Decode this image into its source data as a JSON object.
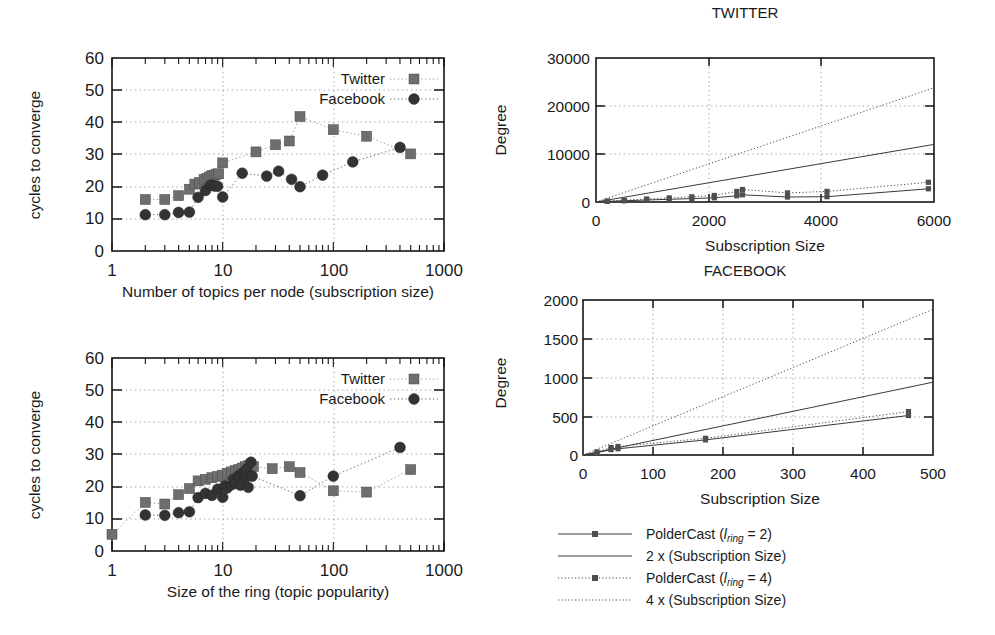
{
  "figure": {
    "panels": [
      "convergence-subscription-size",
      "convergence-ring-size",
      "degree-twitter",
      "degree-facebook"
    ]
  },
  "panel_tl": {
    "ylabel": "cycles to converge",
    "xlabel": "Number of topics per node (subscription size)",
    "yticks": [
      "0",
      "10",
      "20",
      "30",
      "40",
      "50",
      "60"
    ],
    "xticks": [
      "1",
      "10",
      "100",
      "1000"
    ],
    "legend": [
      {
        "label": "Twitter",
        "marker": "square",
        "color": "#6e6e6e"
      },
      {
        "label": "Facebook",
        "marker": "circle",
        "color": "#333333"
      }
    ]
  },
  "panel_bl": {
    "ylabel": "cycles to converge",
    "xlabel": "Size of the ring (topic popularity)",
    "yticks": [
      "0",
      "10",
      "20",
      "30",
      "40",
      "50",
      "60"
    ],
    "xticks": [
      "1",
      "10",
      "100",
      "1000"
    ],
    "legend": [
      {
        "label": "Twitter",
        "marker": "square",
        "color": "#6e6e6e"
      },
      {
        "label": "Facebook",
        "marker": "circle",
        "color": "#333333"
      }
    ]
  },
  "panel_tr": {
    "title": "TWITTER",
    "ylabel": "Degree",
    "xlabel": "Subscription Size",
    "yticks": [
      "0",
      "10000",
      "20000",
      "30000"
    ],
    "xticks": [
      "0",
      "2000",
      "4000",
      "6000"
    ]
  },
  "panel_br": {
    "title": "FACEBOOK",
    "ylabel": "Degree",
    "xlabel": "Subscription Size",
    "yticks": [
      "0",
      "500",
      "1000",
      "1500",
      "2000"
    ],
    "xticks": [
      "0",
      "100",
      "200",
      "300",
      "400",
      "500"
    ]
  },
  "legend_right": {
    "entries": [
      {
        "label_pre": "PolderCast (",
        "label_sym": "l",
        "label_sub": "ring",
        "label_post": " = 2)",
        "style": "solid-with-square"
      },
      {
        "label_pre": "2 x (Subscription Size)",
        "label_sym": "",
        "label_sub": "",
        "label_post": "",
        "style": "solid"
      },
      {
        "label_pre": "PolderCast (",
        "label_sym": "l",
        "label_sub": "ring",
        "label_post": " = 4)",
        "style": "dotted-with-square"
      },
      {
        "label_pre": "4 x (Subscription Size)",
        "label_sym": "",
        "label_sub": "",
        "label_post": "",
        "style": "dotted"
      }
    ]
  },
  "chart_data": [
    {
      "type": "scatter",
      "id": "convergence-vs-subscription-size",
      "title": "",
      "xlabel": "Number of topics per node (subscription size)",
      "ylabel": "cycles to converge",
      "xscale": "log",
      "xlim": [
        1,
        1000
      ],
      "yscale": "linear",
      "ylim": [
        0,
        60
      ],
      "grid": true,
      "legend_position": "top-right",
      "series": [
        {
          "name": "Twitter",
          "marker": "square",
          "color": "#6e6e6e",
          "points": [
            [
              2,
              16
            ],
            [
              3,
              16
            ],
            [
              4,
              17.2
            ],
            [
              5,
              19.2
            ],
            [
              5.6,
              20.8
            ],
            [
              6.2,
              21.3
            ],
            [
              6.8,
              22.3
            ],
            [
              7.2,
              22.6
            ],
            [
              7.6,
              23.0
            ],
            [
              8,
              23.4
            ],
            [
              8.4,
              23.6
            ],
            [
              8.8,
              23.9
            ],
            [
              9.2,
              24.0
            ],
            [
              10,
              27.4
            ],
            [
              20,
              30.8
            ],
            [
              30,
              33.0
            ],
            [
              40,
              34.2
            ],
            [
              50,
              41.8
            ],
            [
              100,
              37.7
            ],
            [
              200,
              35.7
            ],
            [
              500,
              30.2
            ]
          ]
        },
        {
          "name": "Facebook",
          "marker": "circle",
          "color": "#333333",
          "points": [
            [
              2,
              11.3
            ],
            [
              3,
              11.3
            ],
            [
              4,
              12.0
            ],
            [
              5,
              12.1
            ],
            [
              6,
              16.7
            ],
            [
              7,
              18.8
            ],
            [
              7.8,
              20.5
            ],
            [
              8.4,
              20.2
            ],
            [
              9,
              20.1
            ],
            [
              10,
              16.8
            ],
            [
              15,
              24.2
            ],
            [
              25,
              23.3
            ],
            [
              32,
              24.8
            ],
            [
              42,
              22.3
            ],
            [
              50,
              20.0
            ],
            [
              80,
              23.6
            ],
            [
              150,
              27.7
            ],
            [
              400,
              32.2
            ]
          ]
        }
      ]
    },
    {
      "type": "scatter",
      "id": "convergence-vs-ring-size",
      "title": "",
      "xlabel": "Size of the ring (topic popularity)",
      "ylabel": "cycles to converge",
      "xscale": "log",
      "xlim": [
        1,
        1000
      ],
      "yscale": "linear",
      "ylim": [
        0,
        60
      ],
      "grid": true,
      "legend_position": "top-right",
      "series": [
        {
          "name": "Twitter",
          "marker": "square",
          "color": "#6e6e6e",
          "points": [
            [
              1,
              5.2
            ],
            [
              2,
              15.1
            ],
            [
              3,
              14.6
            ],
            [
              4,
              17.5
            ],
            [
              5,
              19.4
            ],
            [
              6,
              21.8
            ],
            [
              7,
              22.3
            ],
            [
              8,
              22.8
            ],
            [
              9,
              23.2
            ],
            [
              10,
              23.6
            ],
            [
              11,
              24.2
            ],
            [
              12,
              24.6
            ],
            [
              13,
              25.0
            ],
            [
              14,
              25.4
            ],
            [
              15,
              25.8
            ],
            [
              16,
              26.2
            ],
            [
              17,
              26.5
            ],
            [
              18,
              26.8
            ],
            [
              19,
              26.2
            ],
            [
              28,
              25.6
            ],
            [
              40,
              26.2
            ],
            [
              50,
              24.4
            ],
            [
              100,
              18.7
            ],
            [
              200,
              18.3
            ],
            [
              500,
              25.3
            ]
          ]
        },
        {
          "name": "Facebook",
          "marker": "circle",
          "color": "#333333",
          "points": [
            [
              2,
              11.2
            ],
            [
              3,
              11.1
            ],
            [
              4,
              11.9
            ],
            [
              5,
              12.2
            ],
            [
              6,
              16.6
            ],
            [
              7,
              17.9
            ],
            [
              8,
              17.3
            ],
            [
              9,
              19.2
            ],
            [
              10,
              16.7
            ],
            [
              10.5,
              20.3
            ],
            [
              11,
              19.6
            ],
            [
              12,
              20.6
            ],
            [
              12.5,
              22.3
            ],
            [
              13,
              21.0
            ],
            [
              14,
              23.4
            ],
            [
              14.5,
              20.5
            ],
            [
              15,
              24.2
            ],
            [
              16,
              22.8
            ],
            [
              16.5,
              25.5
            ],
            [
              17,
              19.8
            ],
            [
              18,
              27.6
            ],
            [
              18.5,
              23.3
            ],
            [
              50,
              17.2
            ],
            [
              100,
              23.3
            ],
            [
              400,
              32.2
            ]
          ]
        }
      ]
    },
    {
      "type": "line",
      "id": "degree-twitter",
      "title": "TWITTER",
      "xlabel": "Subscription Size",
      "ylabel": "Degree",
      "xlim": [
        0,
        6000
      ],
      "ylim": [
        0,
        30000
      ],
      "grid": true,
      "series": [
        {
          "name": "PolderCast (l_ring = 2)",
          "style": "solid-with-square",
          "points": [
            [
              0,
              0
            ],
            [
              200,
              120
            ],
            [
              500,
              260
            ],
            [
              900,
              420
            ],
            [
              1300,
              560
            ],
            [
              1700,
              700
            ],
            [
              2100,
              880
            ],
            [
              2500,
              1300
            ],
            [
              2600,
              1500
            ],
            [
              3400,
              1050
            ],
            [
              4100,
              1100
            ],
            [
              5900,
              2750
            ]
          ]
        },
        {
          "name": "2 x (Subscription Size)",
          "style": "solid",
          "points": [
            [
              0,
              0
            ],
            [
              6000,
              12000
            ]
          ]
        },
        {
          "name": "PolderCast (l_ring = 4)",
          "style": "dotted-with-square",
          "points": [
            [
              0,
              0
            ],
            [
              200,
              180
            ],
            [
              500,
              380
            ],
            [
              900,
              620
            ],
            [
              1300,
              860
            ],
            [
              1700,
              1080
            ],
            [
              2100,
              1350
            ],
            [
              2500,
              2200
            ],
            [
              2600,
              2600
            ],
            [
              3400,
              1900
            ],
            [
              4100,
              2200
            ],
            [
              5900,
              4100
            ]
          ]
        },
        {
          "name": "4 x (Subscription Size)",
          "style": "dotted",
          "points": [
            [
              0,
              0
            ],
            [
              6000,
              23800
            ]
          ]
        }
      ]
    },
    {
      "type": "line",
      "id": "degree-facebook",
      "title": "FACEBOOK",
      "xlabel": "Subscription Size",
      "ylabel": "Degree",
      "xlim": [
        0,
        500
      ],
      "ylim": [
        0,
        2000
      ],
      "grid": true,
      "series": [
        {
          "name": "PolderCast (l_ring = 2)",
          "style": "solid-with-square",
          "points": [
            [
              0,
              0
            ],
            [
              20,
              30
            ],
            [
              40,
              70
            ],
            [
              50,
              80
            ],
            [
              175,
              195
            ],
            [
              465,
              510
            ]
          ]
        },
        {
          "name": "2 x (Subscription Size)",
          "style": "solid",
          "points": [
            [
              0,
              0
            ],
            [
              500,
              940
            ]
          ]
        },
        {
          "name": "PolderCast (l_ring = 4)",
          "style": "dotted-with-square",
          "points": [
            [
              0,
              0
            ],
            [
              20,
              40
            ],
            [
              40,
              95
            ],
            [
              50,
              110
            ],
            [
              175,
              215
            ],
            [
              465,
              560
            ]
          ]
        },
        {
          "name": "4 x (Subscription Size)",
          "style": "dotted",
          "points": [
            [
              0,
              0
            ],
            [
              500,
              1880
            ]
          ]
        }
      ]
    }
  ]
}
